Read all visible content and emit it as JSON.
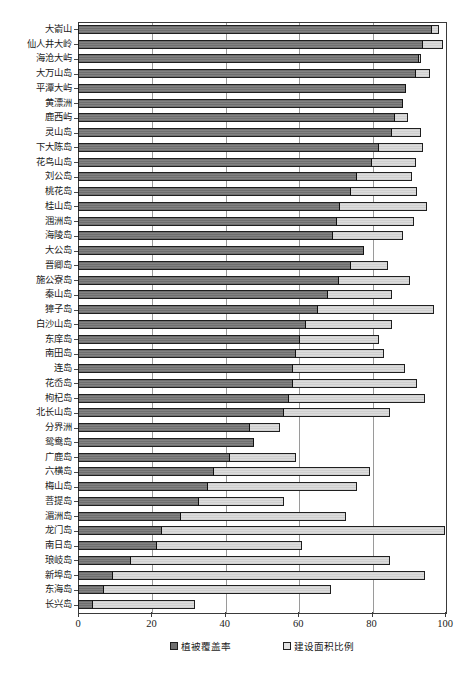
{
  "chart_data": {
    "type": "bar",
    "subtype": "stacked-horizontal",
    "title": "",
    "xlabel": "",
    "ylabel": "",
    "xlim": [
      0,
      100
    ],
    "xticks": [
      0,
      20,
      40,
      60,
      80,
      100
    ],
    "grid": true,
    "legend_position": "bottom",
    "legend": [
      "植被覆盖率",
      "建设面积比例"
    ],
    "categories": [
      "大嵛山",
      "仙人井大岭",
      "海沧大屿",
      "大万山岛",
      "平潭大屿",
      "黄漂洲",
      "鹿西屿",
      "灵山岛",
      "下大陈岛",
      "花鸟山岛",
      "刘公岛",
      "桃花岛",
      "桂山岛",
      "涠洲岛",
      "海陵岛",
      "大公岛",
      "晋卿岛",
      "施公寮岛",
      "秦山岛",
      "獐子岛",
      "白沙山岛",
      "东庠岛",
      "南田岛",
      "连岛",
      "花岙岛",
      "枸杞岛",
      "北长山岛",
      "分界洲",
      "鸳鸯岛",
      "广鹿岛",
      "六横岛",
      "梅山岛",
      "菩提岛",
      "湄洲岛",
      "龙门岛",
      "南日岛",
      "琅岐岛",
      "新埠岛",
      "东海岛",
      "长兴岛"
    ],
    "series": [
      {
        "name": "植被覆盖率",
        "color": "#7a7a7a",
        "values": [
          96.5,
          94.0,
          93.0,
          92.0,
          89.5,
          88.5,
          86.5,
          85.5,
          82.0,
          80.0,
          76.0,
          74.5,
          71.5,
          70.5,
          69.5,
          78.0,
          74.5,
          71.0,
          68.0,
          65.5,
          62.0,
          60.5,
          59.5,
          58.5,
          58.5,
          57.5,
          56.0,
          47.0,
          48.0,
          41.5,
          37.0,
          35.5,
          33.0,
          28.0,
          23.0,
          21.5,
          14.5,
          9.5,
          7.0,
          4.0
        ]
      },
      {
        "name": "建设面积比例",
        "color": "#dcdcdc",
        "values": [
          2.0,
          5.5,
          0.5,
          4.0,
          0.0,
          0.0,
          3.5,
          8.0,
          12.0,
          12.0,
          15.0,
          18.0,
          23.5,
          21.0,
          19.0,
          0.0,
          10.0,
          19.5,
          17.5,
          31.5,
          23.5,
          21.5,
          24.0,
          30.5,
          34.0,
          37.0,
          29.0,
          8.0,
          0.0,
          18.0,
          42.5,
          40.5,
          23.0,
          45.0,
          77.0,
          39.5,
          70.5,
          85.0,
          62.0,
          28.0
        ]
      }
    ]
  },
  "axis": {
    "tick_labels": [
      "0",
      "20",
      "40",
      "60",
      "80",
      "100"
    ]
  }
}
